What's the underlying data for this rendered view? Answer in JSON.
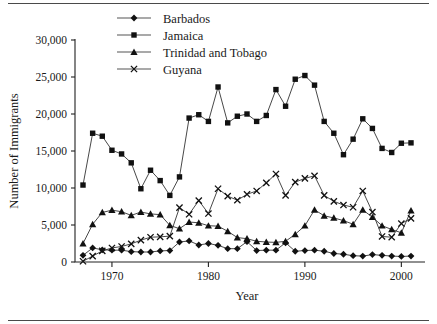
{
  "chart_data": {
    "type": "line",
    "title": "",
    "xlabel": "Year",
    "ylabel": "Number of Immigrants",
    "xlim": [
      1967,
      2001
    ],
    "ylim": [
      0,
      30000
    ],
    "grid": false,
    "legend_position": "top-center",
    "x_tick_labels": [
      "1970",
      "1980",
      "1990",
      "2000"
    ],
    "x_ticks": [
      1970,
      1980,
      1990,
      2000
    ],
    "y_tick_labels": [
      "0",
      "5,000",
      "10,000",
      "15,000",
      "20,000",
      "25,000",
      "30,000"
    ],
    "y_ticks": [
      0,
      5000,
      10000,
      15000,
      20000,
      25000,
      30000
    ],
    "x": [
      1967,
      1968,
      1969,
      1970,
      1971,
      1972,
      1973,
      1974,
      1975,
      1976,
      1977,
      1978,
      1979,
      1980,
      1981,
      1982,
      1983,
      1984,
      1985,
      1986,
      1987,
      1988,
      1989,
      1990,
      1991,
      1992,
      1993,
      1994,
      1995,
      1996,
      1997,
      1998,
      1999,
      2000,
      2001
    ],
    "series": [
      {
        "name": "Barbados",
        "marker": "diamond",
        "values": [
          900,
          1900,
          1650,
          1600,
          1600,
          1400,
          1350,
          1350,
          1500,
          1550,
          2700,
          2850,
          2300,
          2500,
          2250,
          1800,
          1800,
          2750,
          1550,
          1600,
          1600,
          2600,
          1450,
          1550,
          1600,
          1450,
          1150,
          1050,
          850,
          800,
          1000,
          900,
          800,
          750,
          800
        ]
      },
      {
        "name": "Jamaica",
        "marker": "square",
        "values": [
          10400,
          17400,
          17000,
          15100,
          14600,
          13400,
          9900,
          12400,
          11000,
          9000,
          11500,
          19450,
          19900,
          19000,
          23650,
          18800,
          19700,
          20000,
          19000,
          19800,
          23300,
          21050,
          24700,
          25200,
          23900,
          19000,
          17400,
          14500,
          16600,
          19350,
          18050,
          15350,
          14800,
          16050,
          16100
        ]
      },
      {
        "name": "Trinidad and Tobago",
        "marker": "triangle",
        "values": [
          2500,
          5100,
          6700,
          7000,
          6800,
          6300,
          6750,
          6500,
          6400,
          4950,
          4500,
          5400,
          5300,
          4900,
          4850,
          4150,
          3300,
          3150,
          2800,
          2700,
          2650,
          2800,
          3750,
          4900,
          7050,
          6250,
          5950,
          5600,
          5100,
          7050,
          6050,
          4900,
          4400,
          3950,
          6950
        ]
      },
      {
        "name": "Guyana",
        "marker": "x",
        "values": [
          100,
          800,
          1500,
          1900,
          2100,
          2450,
          2950,
          3350,
          3400,
          3500,
          7350,
          6450,
          8300,
          6550,
          9900,
          8900,
          8350,
          9150,
          9600,
          10700,
          11900,
          9000,
          10800,
          11300,
          11650,
          9000,
          8200,
          7700,
          7400,
          9600,
          6750,
          3450,
          3350,
          5200,
          5900
        ]
      }
    ]
  },
  "legend": {
    "items": [
      {
        "label": "Barbados",
        "marker": "diamond"
      },
      {
        "label": "Jamaica",
        "marker": "square"
      },
      {
        "label": "Trinidad and Tobago",
        "marker": "triangle"
      },
      {
        "label": "Guyana",
        "marker": "x"
      }
    ]
  }
}
